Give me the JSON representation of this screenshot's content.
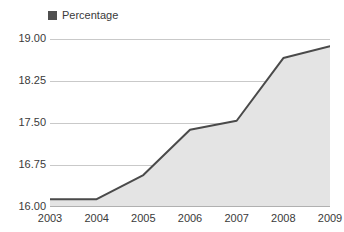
{
  "legend": {
    "position": "top-left",
    "entries": [
      {
        "label": "Percentage",
        "color": "#4f4f4f",
        "marker": "square"
      }
    ]
  },
  "colors": {
    "line": "#4a4a4a",
    "area_fill": "#e4e4e4",
    "gridline": "#c9c9c9",
    "axis": "#b0b0b0",
    "text": "#3a3a3a",
    "background": "#ffffff"
  },
  "chart_data": {
    "type": "area",
    "title": "",
    "subtitle": "",
    "xlabel": "",
    "ylabel": "",
    "categories": [
      "2003",
      "2004",
      "2005",
      "2006",
      "2007",
      "2008",
      "2009"
    ],
    "x": [
      2003,
      2004,
      2005,
      2006,
      2007,
      2008,
      2009
    ],
    "series": [
      {
        "name": "Percentage",
        "color": "#4a4a4a",
        "values": [
          16.14,
          16.14,
          16.57,
          17.38,
          17.54,
          18.66,
          18.87
        ]
      }
    ],
    "values": [
      16.14,
      16.14,
      16.57,
      17.38,
      17.54,
      18.66,
      18.87
    ],
    "ylim": [
      16.0,
      19.0
    ],
    "xlim": [
      2003,
      2009
    ],
    "yticks": [
      16.0,
      16.75,
      17.5,
      18.25,
      19.0
    ],
    "ytick_labels": [
      "16.00",
      "16.75",
      "17.50",
      "18.25",
      "19.00"
    ],
    "xticks": [
      2003,
      2004,
      2005,
      2006,
      2007,
      2008,
      2009
    ],
    "xtick_labels": [
      "2003",
      "2004",
      "2005",
      "2006",
      "2007",
      "2008",
      "2009"
    ],
    "grid": true,
    "grid_axis": "y",
    "legend_position": "top-left",
    "annotations": []
  }
}
